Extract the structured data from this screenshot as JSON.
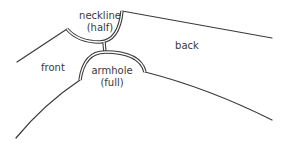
{
  "diagram": {
    "labels": {
      "neckline_line1": "neckline",
      "neckline_line2": "(half)",
      "back": "back",
      "front": "front",
      "armhole_line1": "armhole",
      "armhole_line2": "(full)"
    },
    "colors": {
      "line": "#3a3a3a",
      "background": "#ffffff"
    }
  }
}
